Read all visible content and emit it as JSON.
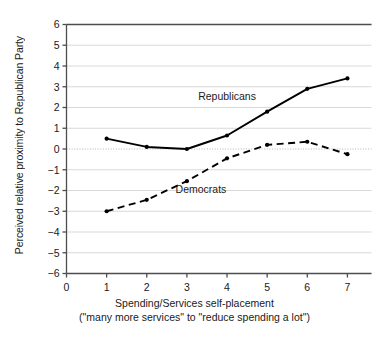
{
  "chart_data": {
    "type": "line",
    "title": "",
    "xlabel": "Spending/Services self-placement",
    "xlabel_sub": "(\"many more services\" to \"reduce spending a lot\")",
    "ylabel": "Perceived relative proximity to Republican Party",
    "x": [
      1,
      2,
      3,
      4,
      5,
      6,
      7
    ],
    "xlim": [
      0,
      7.6
    ],
    "ylim": [
      -6,
      6
    ],
    "xticks": [
      "0",
      "1",
      "2",
      "3",
      "4",
      "5",
      "6",
      "7"
    ],
    "xtick_values": [
      0,
      1,
      2,
      3,
      4,
      5,
      6,
      7
    ],
    "yticks": [
      "6",
      "5",
      "4",
      "3",
      "2",
      "1",
      "0",
      "−1",
      "−2",
      "−3",
      "−4",
      "−5",
      "−6"
    ],
    "ytick_values": [
      6,
      5,
      4,
      3,
      2,
      1,
      0,
      -1,
      -2,
      -3,
      -4,
      -5,
      -6
    ],
    "grid": true,
    "zero_line": true,
    "legend_position": "inline-annotation",
    "series": [
      {
        "name": "Republicans",
        "style": "solid",
        "color": "#000000",
        "values": [
          0.5,
          0.1,
          0.0,
          0.65,
          1.8,
          2.9,
          3.4
        ],
        "label_x": 4.0,
        "label_y": 2.35
      },
      {
        "name": "Democrats",
        "style": "dashed",
        "color": "#000000",
        "values": [
          -3.0,
          -2.45,
          -1.55,
          -0.45,
          0.2,
          0.35,
          -0.25
        ],
        "label_x": 3.35,
        "label_y": -2.1
      }
    ]
  },
  "colors": {
    "axis": "#4d4d4d",
    "grid": "#d9d9d9",
    "zero_line": "#b3b3b3",
    "series": "#000000",
    "text": "#1a1a1a",
    "background": "#ffffff"
  }
}
